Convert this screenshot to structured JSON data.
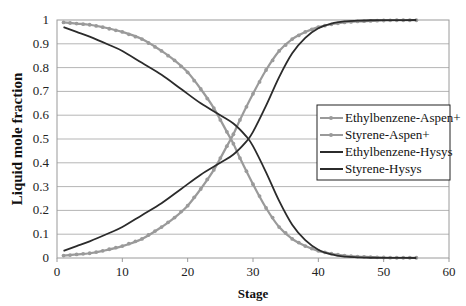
{
  "chart_data": {
    "type": "line",
    "title": "",
    "xlabel": "Stage",
    "ylabel": "Liquid mole fraction",
    "xlim": [
      0,
      60
    ],
    "ylim": [
      0,
      1
    ],
    "xticks": [
      0,
      10,
      20,
      30,
      40,
      50,
      60
    ],
    "yticks": [
      0,
      0.1,
      0.2,
      0.3,
      0.4,
      0.5,
      0.6,
      0.7,
      0.8,
      0.9,
      1
    ],
    "ytick_labels": [
      "0",
      "0.1",
      "0.2",
      "0.3",
      "0.4",
      "0.5",
      "0.6",
      "0.7",
      "0.8",
      "0.9",
      "1"
    ],
    "xtick_labels": [
      "0",
      "10",
      "20",
      "30",
      "40",
      "50",
      "60"
    ],
    "grid": "horizontal",
    "legend_position": "right-center",
    "series": [
      {
        "name": "Ethylbenzene-Aspen+",
        "color": "#9a9a9a",
        "marker": true,
        "x": [
          1,
          3,
          5,
          7,
          10,
          13,
          16,
          18,
          20,
          22,
          24,
          26,
          27,
          28,
          30,
          32,
          34,
          36,
          38,
          40,
          42,
          44,
          46,
          48,
          50,
          52,
          55
        ],
        "y": [
          0.99,
          0.985,
          0.98,
          0.97,
          0.95,
          0.92,
          0.87,
          0.83,
          0.78,
          0.71,
          0.63,
          0.53,
          0.48,
          0.42,
          0.31,
          0.21,
          0.13,
          0.08,
          0.05,
          0.03,
          0.018,
          0.01,
          0.006,
          0.004,
          0.002,
          0.001,
          0.001
        ]
      },
      {
        "name": "Styrene-Aspen+",
        "color": "#9a9a9a",
        "marker": true,
        "x": [
          1,
          3,
          5,
          7,
          10,
          13,
          16,
          18,
          20,
          22,
          24,
          26,
          27,
          28,
          30,
          32,
          34,
          36,
          38,
          40,
          42,
          44,
          46,
          48,
          50,
          52,
          55
        ],
        "y": [
          0.01,
          0.015,
          0.02,
          0.03,
          0.05,
          0.08,
          0.13,
          0.17,
          0.22,
          0.29,
          0.37,
          0.47,
          0.52,
          0.58,
          0.69,
          0.79,
          0.87,
          0.92,
          0.95,
          0.97,
          0.982,
          0.99,
          0.994,
          0.996,
          0.998,
          0.999,
          0.999
        ]
      },
      {
        "name": "Ethylbenzene-Hysys",
        "color": "#2b2b2b",
        "marker": false,
        "x": [
          1,
          3,
          5,
          8,
          10,
          13,
          16,
          19,
          22,
          25,
          27,
          29,
          30,
          32,
          34,
          36,
          38,
          40,
          42,
          44,
          46,
          48,
          50,
          52,
          55
        ],
        "y": [
          0.97,
          0.95,
          0.93,
          0.895,
          0.87,
          0.82,
          0.77,
          0.71,
          0.65,
          0.6,
          0.565,
          0.51,
          0.47,
          0.36,
          0.24,
          0.14,
          0.075,
          0.035,
          0.015,
          0.006,
          0.003,
          0.001,
          0.0005,
          0.0002,
          0.0001
        ]
      },
      {
        "name": "Styrene-Hysys",
        "color": "#2b2b2b",
        "marker": false,
        "x": [
          1,
          3,
          5,
          8,
          10,
          13,
          16,
          19,
          22,
          25,
          27,
          29,
          30,
          32,
          34,
          36,
          38,
          40,
          42,
          44,
          46,
          48,
          50,
          52,
          55
        ],
        "y": [
          0.03,
          0.05,
          0.07,
          0.105,
          0.13,
          0.18,
          0.23,
          0.29,
          0.35,
          0.4,
          0.435,
          0.49,
          0.53,
          0.64,
          0.76,
          0.86,
          0.925,
          0.965,
          0.985,
          0.994,
          0.997,
          0.999,
          0.9995,
          0.9998,
          0.9999
        ]
      }
    ]
  },
  "legend": {
    "items": [
      {
        "label": "Ethylbenzene-Aspen+",
        "color": "#9a9a9a",
        "marker": true
      },
      {
        "label": "Styrene-Aspen+",
        "color": "#9a9a9a",
        "marker": true
      },
      {
        "label": "Ethylbenzene-Hysys",
        "color": "#2b2b2b",
        "marker": false
      },
      {
        "label": "Styrene-Hysys",
        "color": "#2b2b2b",
        "marker": false
      }
    ]
  },
  "axes": {
    "xlabel": "Stage",
    "ylabel": "Liquid mole fraction"
  }
}
